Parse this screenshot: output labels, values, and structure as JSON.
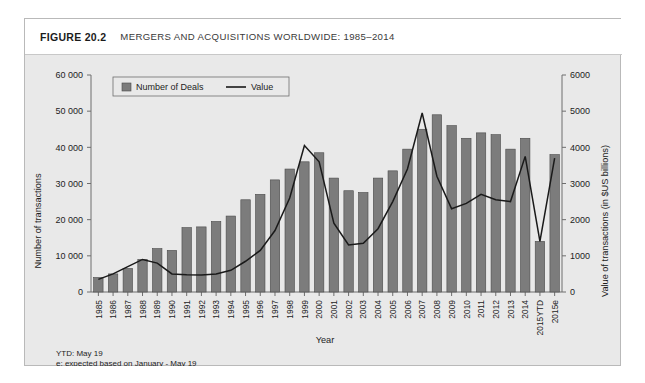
{
  "figure": {
    "number": "FIGURE 20.2",
    "title": "MERGERS AND ACQUISITIONS WORLDWIDE: 1985–2014"
  },
  "footnotes": {
    "ytd": "YTD: May 19",
    "expected": "e: expected based on January - May 19"
  },
  "colors": {
    "panel_background": "#e9e9e9",
    "bar_fill": "#7c7c7c",
    "bar_stroke": "#4a4a4a",
    "line": "#1a1a1a",
    "axis": "#6e6e6e",
    "title_bar": "#ffffff"
  },
  "chart_data": {
    "type": "bar",
    "title": "MERGERS AND ACQUISITIONS WORLDWIDE: 1985–2014",
    "xlabel": "Year",
    "ylabel": "Number of transactions",
    "y2label": "Value of transactions (in $US billions)",
    "ylim": [
      0,
      60000
    ],
    "y2lim": [
      0,
      6000
    ],
    "yticks": [
      0,
      10000,
      20000,
      30000,
      40000,
      50000,
      60000
    ],
    "ytick_labels": [
      "0",
      "10 000",
      "20 000",
      "30 000",
      "40 000",
      "50 000",
      "60 000"
    ],
    "y2ticks": [
      0,
      1000,
      2000,
      3000,
      4000,
      5000,
      6000
    ],
    "y2tick_labels": [
      "0",
      "1000",
      "2000",
      "3000",
      "4000",
      "5000",
      "6000"
    ],
    "grid": false,
    "legend_position": "top-left",
    "categories": [
      "1985",
      "1986",
      "1987",
      "1988",
      "1989",
      "1990",
      "1991",
      "1992",
      "1993",
      "1994",
      "1995",
      "1996",
      "1997",
      "1998",
      "1999",
      "2000",
      "2001",
      "2002",
      "2003",
      "2004",
      "2005",
      "2006",
      "2007",
      "2008",
      "2009",
      "2010",
      "2011",
      "2012",
      "2013",
      "2014",
      "2015YTD",
      "2015e"
    ],
    "series": [
      {
        "name": "Number of Deals",
        "type": "bar",
        "axis": "left",
        "unit": "transactions",
        "values": [
          4000,
          5000,
          6500,
          9000,
          12000,
          11500,
          17800,
          18000,
          19500,
          21000,
          25500,
          27000,
          31000,
          34000,
          36000,
          38500,
          31500,
          28000,
          27500,
          31500,
          33500,
          39500,
          45000,
          49000,
          46000,
          42500,
          44000,
          43500,
          39500,
          42500,
          14000,
          38000
        ]
      },
      {
        "name": "Value",
        "type": "line",
        "axis": "right",
        "unit": "$US billions",
        "values": [
          350,
          500,
          700,
          900,
          800,
          500,
          480,
          470,
          500,
          600,
          850,
          1150,
          1700,
          2600,
          4050,
          3600,
          1900,
          1300,
          1350,
          1750,
          2500,
          3400,
          4950,
          3200,
          2300,
          2450,
          2700,
          2550,
          2500,
          3750,
          1400,
          3700
        ]
      }
    ],
    "annotations": [
      "YTD: May 19",
      "e: expected based on January - May 19"
    ]
  }
}
